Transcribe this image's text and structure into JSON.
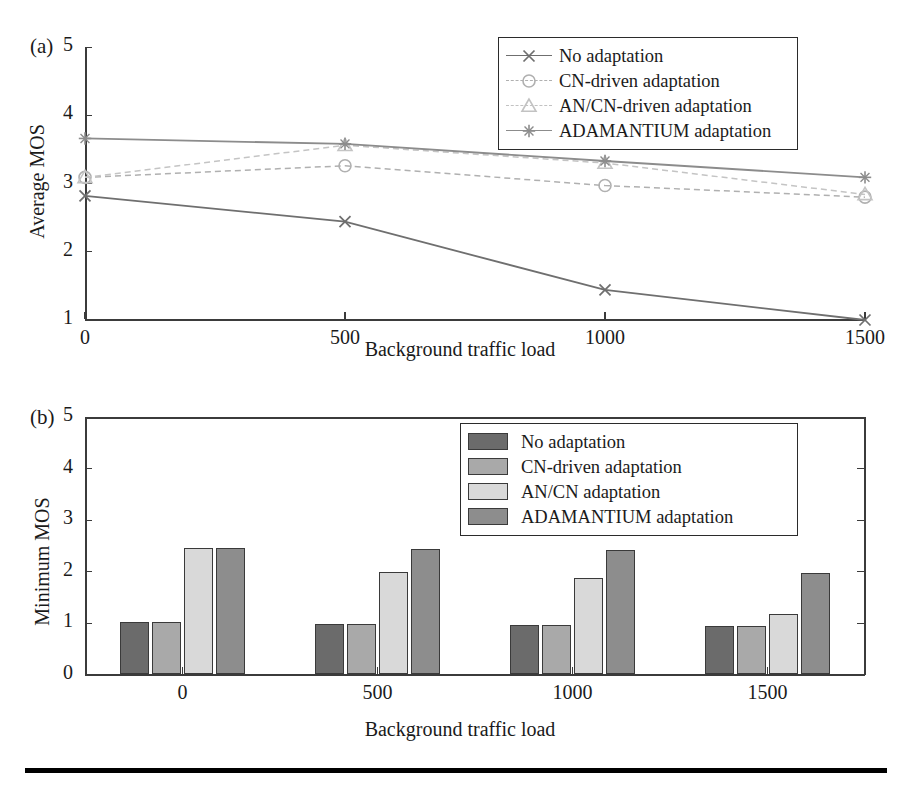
{
  "figure": {
    "panel_a_tag": "(a)",
    "panel_b_tag": "(b)",
    "bottom_rule": true
  },
  "chart_data": [
    {
      "type": "line",
      "panel": "(a)",
      "title": "",
      "xlabel": "Background traffic load",
      "ylabel": "Average MOS",
      "x": [
        0,
        500,
        1000,
        1500
      ],
      "xtick_labels": [
        "0",
        "500",
        "1000",
        "1500"
      ],
      "ytick_labels": [
        "1",
        "2",
        "3",
        "4",
        "5"
      ],
      "xlim": [
        0,
        1500
      ],
      "ylim": [
        1,
        5
      ],
      "grid": false,
      "legend_position": "top-right",
      "series": [
        {
          "name": "No adaptation",
          "values": [
            2.82,
            2.44,
            1.44,
            1.0
          ],
          "marker": "x-marker",
          "linestyle": "solid",
          "color": "#6f6f6f"
        },
        {
          "name": "CN-driven adaptation",
          "values": [
            3.09,
            3.26,
            2.97,
            2.8
          ],
          "marker": "circle-marker",
          "linestyle": "dashed",
          "color": "#b0b0b0"
        },
        {
          "name": "AN/CN-driven adaptation",
          "values": [
            3.09,
            3.56,
            3.3,
            2.84
          ],
          "marker": "triangle-marker",
          "linestyle": "dashed",
          "color": "#c4c4c4"
        },
        {
          "name": "ADAMANTIUM adaptation",
          "values": [
            3.66,
            3.58,
            3.33,
            3.09
          ],
          "marker": "star-marker",
          "linestyle": "solid",
          "color": "#8c8c8c"
        }
      ]
    },
    {
      "type": "bar",
      "panel": "(b)",
      "title": "",
      "xlabel": "Background traffic load",
      "ylabel": "Minimum MOS",
      "categories": [
        "0",
        "500",
        "1000",
        "1500"
      ],
      "xtick_labels": [
        "0",
        "500",
        "1000",
        "1500"
      ],
      "ytick_labels": [
        "0",
        "1",
        "2",
        "3",
        "4",
        "5"
      ],
      "ylim": [
        0,
        5
      ],
      "grid": false,
      "legend_position": "top-right",
      "series": [
        {
          "name": "No adaptation",
          "values": [
            1.0,
            0.97,
            0.96,
            0.94
          ],
          "color": "#6b6b6b"
        },
        {
          "name": "CN-driven adaptation",
          "values": [
            1.0,
            0.97,
            0.95,
            0.94
          ],
          "color": "#a9a9a9"
        },
        {
          "name": "AN/CN adaptation",
          "values": [
            2.45,
            1.97,
            1.87,
            1.17
          ],
          "color": "#d9d9d9"
        },
        {
          "name": "ADAMANTIUM adaptation",
          "values": [
            2.45,
            2.43,
            2.41,
            1.95
          ],
          "color": "#8d8d8d"
        }
      ]
    }
  ],
  "legend_a": {
    "items": [
      {
        "label": "No adaptation",
        "marker": "x-marker",
        "linestyle": "solid",
        "color": "#6f6f6f"
      },
      {
        "label": "CN-driven adaptation",
        "marker": "circle-marker",
        "linestyle": "dashed",
        "color": "#b0b0b0"
      },
      {
        "label": "AN/CN-driven adaptation",
        "marker": "triangle-marker",
        "linestyle": "dashed",
        "color": "#c2c2c2"
      },
      {
        "label": "ADAMANTIUM adaptation",
        "marker": "star-marker",
        "linestyle": "solid",
        "color": "#8c8c8c"
      }
    ]
  },
  "legend_b": {
    "items": [
      {
        "label": "No adaptation",
        "color": "#6b6b6b"
      },
      {
        "label": "CN-driven adaptation",
        "color": "#a9a9a9"
      },
      {
        "label": "AN/CN adaptation",
        "color": "#d9d9d9"
      },
      {
        "label": "ADAMANTIUM adaptation",
        "color": "#8d8d8d"
      }
    ]
  }
}
